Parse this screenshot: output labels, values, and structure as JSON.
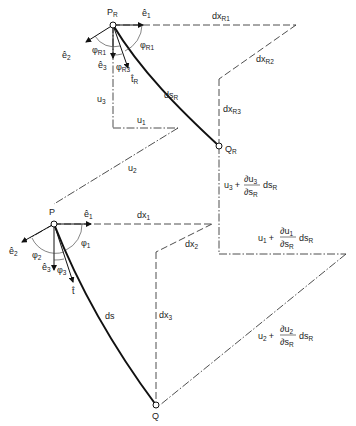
{
  "diagram": {
    "colors": {
      "ink": "#222222",
      "background": "#ffffff"
    },
    "points": {
      "PR": {
        "base": "P",
        "sub": "R"
      },
      "QR": {
        "base": "Q",
        "sub": "R"
      },
      "P": {
        "base": "P"
      },
      "Q": {
        "base": "Q"
      }
    },
    "upper": {
      "e1": "ê",
      "e1_sub": "1",
      "e2": "ê",
      "e2_sub": "2",
      "e3": "ê",
      "e3_sub": "3",
      "t": "t̂",
      "t_sub": "R",
      "phiR1": "φ",
      "phiR1_sub": "R1",
      "phiR2": "φ",
      "phiR2_sub": "R1",
      "phiR3": "φ",
      "phiR3_sub": "R3",
      "ds": "ds",
      "ds_sub": "R",
      "dx1": "dx",
      "dx1_sub": "R1",
      "dx2": "dx",
      "dx2_sub": "R2",
      "dx3": "dx",
      "dx3_sub": "R3"
    },
    "lower": {
      "e1": "ê",
      "e1_sub": "1",
      "e2": "ê",
      "e2_sub": "2",
      "e3": "ê",
      "e3_sub": "3",
      "t": "t̂",
      "phi1": "φ",
      "phi1_sub": "1",
      "phi2": "φ",
      "phi2_sub": "2",
      "phi3": "φ",
      "phi3_sub": "3",
      "ds": "ds",
      "dx1": "dx",
      "dx1_sub": "1",
      "dx2": "dx",
      "dx2_sub": "2",
      "dx3": "dx",
      "dx3_sub": "3"
    },
    "displacements": {
      "u1": "u",
      "u1_sub": "1",
      "u2": "u",
      "u2_sub": "2",
      "u3": "u",
      "u3_sub": "3",
      "u3_plus": {
        "u": "u",
        "usub": "3",
        "plus": "+",
        "num": "∂u",
        "numsub": "3",
        "den": "∂s",
        "densub": "R",
        "tail": "ds",
        "tailsub": "R"
      },
      "u1_plus": {
        "u": "u",
        "usub": "1",
        "plus": "+",
        "num": "∂u",
        "numsub": "1",
        "den": "∂s",
        "densub": "R",
        "tail": "ds",
        "tailsub": "R"
      },
      "u2_plus": {
        "u": "u",
        "usub": "2",
        "plus": "+",
        "num": "∂u",
        "numsub": "2",
        "den": "∂s",
        "densub": "R",
        "tail": "ds",
        "tailsub": "R"
      }
    }
  }
}
